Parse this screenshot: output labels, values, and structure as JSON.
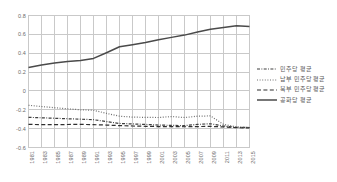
{
  "chart_data": {
    "type": "line",
    "title": "",
    "xlabel": "",
    "ylabel": "",
    "ylim": [
      -0.6,
      0.8
    ],
    "y_ticks": [
      "0.8",
      "0.6",
      "0.4",
      "0.2",
      "0",
      "-0.2",
      "-0.4",
      "-0.6"
    ],
    "y_tick_values": [
      0.8,
      0.6,
      0.4,
      0.2,
      0,
      -0.2,
      -0.4,
      -0.6
    ],
    "grid": true,
    "legend_position": "right",
    "categories": [
      "1981",
      "1983",
      "1985",
      "1987",
      "1989",
      "1991",
      "1993",
      "1995",
      "1997",
      "1999",
      "2001",
      "2003",
      "2005",
      "2007",
      "2009",
      "2011",
      "2013",
      "2015"
    ],
    "x": [
      1981,
      1983,
      1985,
      1987,
      1989,
      1991,
      1993,
      1995,
      1997,
      1999,
      2001,
      2003,
      2005,
      2007,
      2009,
      2011,
      2013,
      2015
    ],
    "series": [
      {
        "name": "민주당 평균",
        "style": "dash-dot",
        "color": "#3f3f3f",
        "values": [
          -0.28,
          -0.285,
          -0.29,
          -0.295,
          -0.3,
          -0.305,
          -0.325,
          -0.345,
          -0.35,
          -0.355,
          -0.362,
          -0.365,
          -0.368,
          -0.355,
          -0.348,
          -0.372,
          -0.385,
          -0.388
        ]
      },
      {
        "name": "남부 민주당 평균",
        "style": "dotted",
        "color": "#6e6e6e",
        "values": [
          -0.152,
          -0.165,
          -0.178,
          -0.19,
          -0.2,
          -0.205,
          -0.238,
          -0.268,
          -0.278,
          -0.28,
          -0.282,
          -0.272,
          -0.282,
          -0.268,
          -0.265,
          -0.355,
          -0.382,
          -0.388
        ]
      },
      {
        "name": "북부 민주당 평균",
        "style": "dashed",
        "color": "#2e2e2e",
        "values": [
          -0.355,
          -0.357,
          -0.358,
          -0.356,
          -0.355,
          -0.358,
          -0.362,
          -0.368,
          -0.372,
          -0.375,
          -0.378,
          -0.378,
          -0.38,
          -0.378,
          -0.376,
          -0.382,
          -0.39,
          -0.392
        ]
      },
      {
        "name": "공화당 평균",
        "style": "solid",
        "color": "#4a4a4a",
        "values": [
          0.248,
          0.276,
          0.296,
          0.312,
          0.322,
          0.345,
          0.405,
          0.468,
          0.49,
          0.513,
          0.542,
          0.568,
          0.592,
          0.625,
          0.655,
          0.672,
          0.692,
          0.683
        ]
      }
    ]
  },
  "legend": {
    "items": [
      {
        "label": "민주당 평균"
      },
      {
        "label": "남부 민주당 평균"
      },
      {
        "label": "북부 민주당 평균"
      },
      {
        "label": "공화당 평균"
      }
    ]
  },
  "colors": {
    "grid": "#c9c9c9",
    "frame": "#c9c9c9",
    "text": "#6b6b6b",
    "background": "#ffffff"
  }
}
